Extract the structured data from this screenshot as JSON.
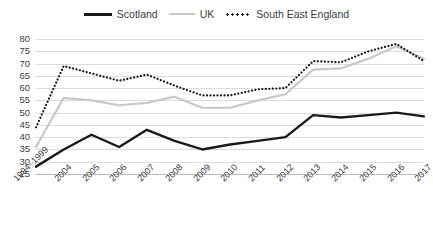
{
  "legend": {
    "position": "top-center",
    "items": [
      {
        "name": "Scotland",
        "style": "solid",
        "color": "#1a1a1a",
        "icon": "line-solid-icon"
      },
      {
        "name": "UK",
        "style": "solid",
        "color": "#c8c8c8",
        "icon": "line-solid-icon"
      },
      {
        "name": "South East England",
        "style": "dotted",
        "color": "#1a1a1a",
        "icon": "line-dotted-icon"
      }
    ]
  },
  "axis": {
    "y_ticks": [
      "80",
      "75",
      "70",
      "65",
      "60",
      "55",
      "50",
      "45",
      "40",
      "35",
      "30",
      "25"
    ],
    "x_ticks": [
      "1994–1999",
      "2004",
      "2005",
      "2006",
      "2007",
      "2008",
      "2009",
      "2010",
      "2011",
      "2012",
      "2013",
      "2014",
      "2015",
      "2016",
      "2017"
    ]
  },
  "chart_data": {
    "type": "line",
    "title": "",
    "subtitle": "",
    "xlabel": "",
    "ylabel": "",
    "ylim": [
      25,
      80
    ],
    "ytick_step": 5,
    "grid": true,
    "legend_position": "top-center",
    "categories": [
      "1994–1999",
      "2004",
      "2005",
      "2006",
      "2007",
      "2008",
      "2009",
      "2010",
      "2011",
      "2012",
      "2013",
      "2014",
      "2015",
      "2016",
      "2017"
    ],
    "series": [
      {
        "name": "Scotland",
        "style": "solid",
        "color": "#1a1a1a",
        "values": [
          28,
          35,
          41,
          36,
          43,
          38.5,
          35,
          37,
          38.5,
          40,
          49,
          48,
          49,
          50,
          48.5
        ]
      },
      {
        "name": "UK",
        "style": "solid",
        "color": "#c8c8c8",
        "values": [
          36,
          56,
          55,
          53,
          54,
          56.5,
          52,
          52,
          55,
          57.5,
          67.5,
          68,
          72,
          77,
          72
        ]
      },
      {
        "name": "South East England",
        "style": "dotted",
        "color": "#1a1a1a",
        "values": [
          44,
          69,
          66,
          63,
          65.5,
          61,
          57,
          57,
          59.5,
          60,
          71,
          70.5,
          75,
          78,
          71
        ]
      }
    ]
  }
}
